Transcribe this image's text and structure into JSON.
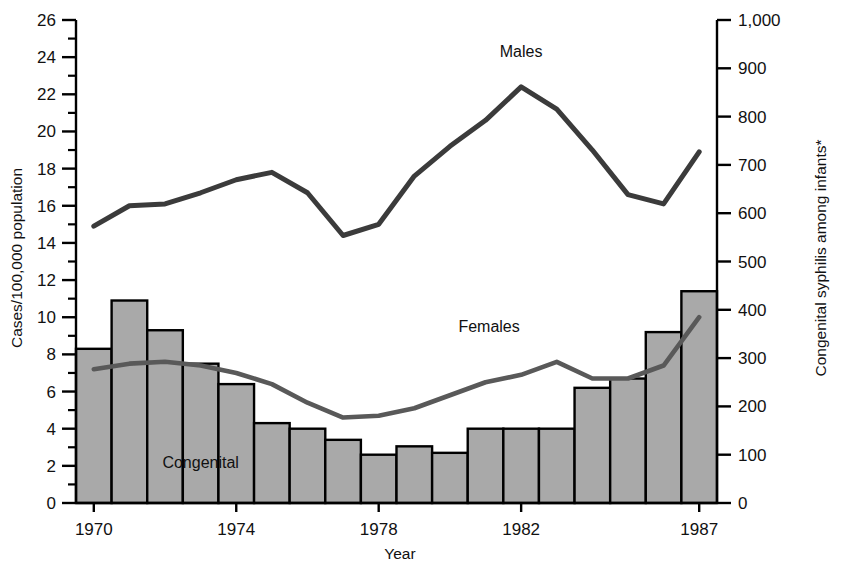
{
  "chart_data": {
    "type": "bar",
    "title": "",
    "xlabel": "Year",
    "ylabel": "Cases/100,000 population",
    "y2label": "Congenital syphilis among infants*",
    "xlim": [
      1969.5,
      1987.5
    ],
    "ylim": [
      0,
      26
    ],
    "y2lim": [
      0,
      1000
    ],
    "grid": false,
    "legend_position": "inline-annotations",
    "x": [
      1970,
      1971,
      1972,
      1973,
      1974,
      1975,
      1976,
      1977,
      1978,
      1979,
      1980,
      1981,
      1982,
      1983,
      1984,
      1985,
      1986,
      1987
    ],
    "categories": [
      "1970",
      "1971",
      "1972",
      "1973",
      "1974",
      "1975",
      "1976",
      "1977",
      "1978",
      "1979",
      "1980",
      "1981",
      "1982",
      "1983",
      "1984",
      "1985",
      "1986",
      "1987"
    ],
    "x_tick_labels": [
      "1970",
      "1974",
      "1978",
      "1982",
      "1987"
    ],
    "x_tick_values": [
      1970,
      1974,
      1978,
      1982,
      1987
    ],
    "y_tick_labels": [
      "0",
      "2",
      "4",
      "6",
      "8",
      "10",
      "12",
      "14",
      "16",
      "18",
      "20",
      "22",
      "24",
      "26"
    ],
    "y_tick_values": [
      0,
      2,
      4,
      6,
      8,
      10,
      12,
      14,
      16,
      18,
      20,
      22,
      24,
      26
    ],
    "y_minor_ticks": [
      1,
      3,
      5,
      7,
      9,
      11,
      13,
      15,
      17,
      19,
      21,
      23,
      25
    ],
    "y2_tick_labels": [
      "0",
      "100",
      "200",
      "300",
      "400",
      "500",
      "600",
      "700",
      "800",
      "900",
      "1,000"
    ],
    "y2_tick_values": [
      0,
      100,
      200,
      300,
      400,
      500,
      600,
      700,
      800,
      900,
      1000
    ],
    "series": [
      {
        "name": "Congenital",
        "render": "bar",
        "axis": "right",
        "label": "Congenital",
        "units": "cases among infants",
        "values_right_axis": [
          325,
          430,
          365,
          295,
          250,
          168,
          156,
          132,
          102,
          120,
          106,
          157,
          157,
          157,
          243,
          262,
          360,
          445
        ],
        "values": [
          8.3,
          10.9,
          9.3,
          7.5,
          6.4,
          4.3,
          4.0,
          3.4,
          2.6,
          3.05,
          2.7,
          4.0,
          4.0,
          4.0,
          6.2,
          6.7,
          9.2,
          11.4
        ]
      },
      {
        "name": "Males",
        "render": "line",
        "axis": "left",
        "label": "Males",
        "values": [
          14.9,
          16.0,
          16.1,
          16.7,
          17.4,
          17.8,
          16.7,
          14.4,
          15.0,
          17.6,
          19.2,
          20.6,
          22.4,
          21.2,
          19.0,
          16.6,
          16.1,
          18.9
        ]
      },
      {
        "name": "Females",
        "render": "line",
        "axis": "left",
        "label": "Females",
        "values": [
          7.2,
          7.5,
          7.6,
          7.4,
          7.0,
          6.4,
          5.4,
          4.6,
          4.7,
          5.1,
          5.8,
          6.5,
          6.9,
          7.6,
          6.7,
          6.7,
          7.4,
          10.0
        ]
      }
    ],
    "annotations": [
      {
        "text": "Males",
        "x": 1982,
        "y": 24.0
      },
      {
        "text": "Females",
        "x": 1981.1,
        "y": 9.2
      },
      {
        "text": "Congenital",
        "x": 1973.0,
        "y": 1.9
      }
    ],
    "colors": {
      "bar_fill": "#a9a9a9",
      "bar_stroke": "#000000",
      "males_line": "#3b3b3b",
      "females_line": "#595959",
      "axis": "#000000",
      "text": "#111111"
    }
  }
}
